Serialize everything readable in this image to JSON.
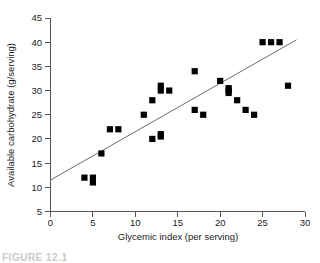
{
  "figure": {
    "caption_fragment": "FIGURE 12.1"
  },
  "chart_data": {
    "type": "scatter",
    "title": "",
    "xlabel": "Glycemic index (per serving)",
    "ylabel": "Available carbohydrate (g/serving)",
    "xlim": [
      0,
      30
    ],
    "ylim": [
      5,
      45
    ],
    "xticks": [
      0,
      5,
      10,
      15,
      20,
      25,
      30
    ],
    "yticks": [
      5,
      10,
      15,
      20,
      25,
      30,
      35,
      40,
      45
    ],
    "xtick_labels": [
      "0",
      "5",
      "10",
      "15",
      "20",
      "25",
      "30"
    ],
    "ytick_labels": [
      "5",
      "10",
      "15",
      "20",
      "25",
      "30",
      "35",
      "40",
      "45"
    ],
    "grid": false,
    "legend": null,
    "marker": "filled-square",
    "marker_color": "#000000",
    "points": [
      {
        "x": 4,
        "y": 12
      },
      {
        "x": 5,
        "y": 12
      },
      {
        "x": 5,
        "y": 11
      },
      {
        "x": 6,
        "y": 17
      },
      {
        "x": 7,
        "y": 22
      },
      {
        "x": 8,
        "y": 22
      },
      {
        "x": 11,
        "y": 25
      },
      {
        "x": 12,
        "y": 20
      },
      {
        "x": 12,
        "y": 28
      },
      {
        "x": 13,
        "y": 20.5
      },
      {
        "x": 13,
        "y": 21
      },
      {
        "x": 13,
        "y": 30
      },
      {
        "x": 13,
        "y": 31
      },
      {
        "x": 14,
        "y": 30
      },
      {
        "x": 17,
        "y": 26
      },
      {
        "x": 17,
        "y": 34
      },
      {
        "x": 18,
        "y": 25
      },
      {
        "x": 20,
        "y": 32
      },
      {
        "x": 21,
        "y": 29.5
      },
      {
        "x": 21,
        "y": 30
      },
      {
        "x": 21,
        "y": 30.5
      },
      {
        "x": 22,
        "y": 28
      },
      {
        "x": 23,
        "y": 26
      },
      {
        "x": 24,
        "y": 25
      },
      {
        "x": 25,
        "y": 40
      },
      {
        "x": 26,
        "y": 40
      },
      {
        "x": 27,
        "y": 40
      },
      {
        "x": 28,
        "y": 31
      }
    ],
    "trendline": {
      "type": "linear",
      "x0": 0,
      "y0": 11.5,
      "x1": 29,
      "y1": 40.5,
      "color": "#6b6b6b"
    }
  }
}
